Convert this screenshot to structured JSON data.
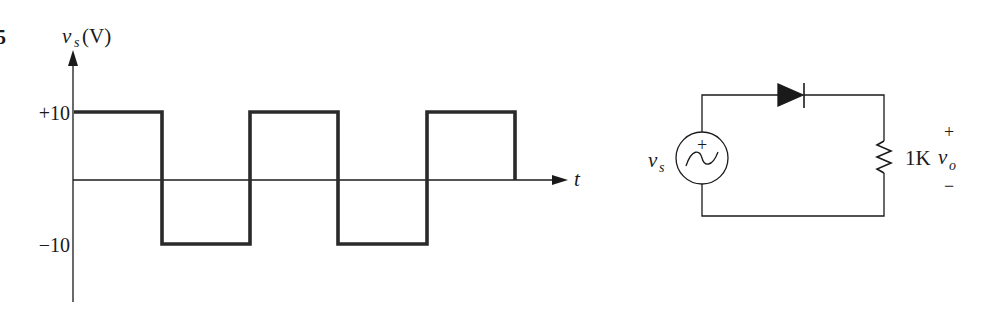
{
  "problem_number": "5",
  "waveform": {
    "y_axis_label_var": "v",
    "y_axis_label_sub": "s",
    "y_axis_label_unit": "(V)",
    "x_axis_label": "t",
    "tick_high": "+10",
    "tick_low": "−10",
    "high_value": 10,
    "low_value": -10,
    "segments": [
      {
        "level": 10,
        "x_start": 73,
        "x_end": 162
      },
      {
        "level": -10,
        "x_start": 162,
        "x_end": 250
      },
      {
        "level": 10,
        "x_start": 250,
        "x_end": 338
      },
      {
        "level": -10,
        "x_start": 338,
        "x_end": 427
      },
      {
        "level": 10,
        "x_start": 427,
        "x_end": 515
      }
    ]
  },
  "circuit": {
    "source_label_var": "v",
    "source_label_sub": "s",
    "source_plus": "+",
    "resistor_label": "1K",
    "output_label_var": "v",
    "output_label_sub": "o",
    "output_plus": "+",
    "output_minus": "−",
    "colors": {
      "line": "#1a1a1a",
      "background": "#ffffff"
    }
  }
}
